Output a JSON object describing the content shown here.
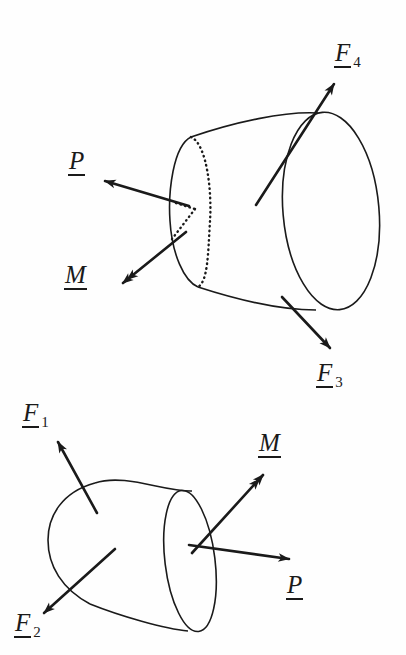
{
  "figure": {
    "background_color": "#fefefe",
    "ink_color": "#1a1a1a",
    "width": 406,
    "height": 655
  },
  "upper_diagram": {
    "name": "upper-body-segment",
    "description": "Truncated cone shown with cut face at left; hidden far edge of the cut section drawn dotted",
    "labels": [
      {
        "id": "F4",
        "symbol": "F",
        "subscript": "4",
        "underlined": true,
        "x": 334,
        "y": 40,
        "arrow": "single"
      },
      {
        "id": "P",
        "symbol": "P",
        "subscript": "",
        "underlined": true,
        "x": 68,
        "y": 148,
        "arrow": "single"
      },
      {
        "id": "M",
        "symbol": "M",
        "subscript": "",
        "underlined": true,
        "x": 64,
        "y": 262,
        "arrow": "double"
      },
      {
        "id": "F3",
        "symbol": "F",
        "subscript": "3",
        "underlined": true,
        "x": 316,
        "y": 360,
        "arrow": "single"
      }
    ]
  },
  "lower_diagram": {
    "name": "lower-body-segment",
    "description": "Mating cone segment with rounded end; cut face at right drawn as full solid ellipse",
    "labels": [
      {
        "id": "F1",
        "symbol": "F",
        "subscript": "1",
        "underlined": true,
        "x": 22,
        "y": 400,
        "arrow": "single"
      },
      {
        "id": "M",
        "symbol": "M",
        "subscript": "",
        "underlined": true,
        "x": 258,
        "y": 430,
        "arrow": "double"
      },
      {
        "id": "P",
        "symbol": "P",
        "subscript": "",
        "underlined": true,
        "x": 286,
        "y": 572,
        "arrow": "single"
      },
      {
        "id": "F2",
        "symbol": "F",
        "subscript": "2",
        "underlined": true,
        "x": 14,
        "y": 610,
        "arrow": "single"
      }
    ]
  }
}
